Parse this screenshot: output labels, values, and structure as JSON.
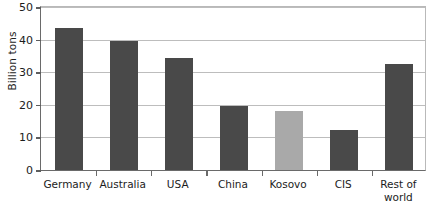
{
  "chart_data": {
    "type": "bar",
    "title": "",
    "xlabel": "",
    "ylabel": "Billion tons",
    "categories": [
      "Germany",
      "Australia",
      "USA",
      "China",
      "Kosovo",
      "CIS",
      "Rest of world"
    ],
    "values": [
      43,
      39,
      34,
      19.5,
      18,
      12,
      32
    ],
    "ylim": [
      0,
      50
    ],
    "yticks": [
      0,
      10,
      20,
      30,
      40,
      50
    ],
    "ytick_labels": [
      "0",
      "10",
      "20",
      "30",
      "40",
      "50"
    ],
    "grid": true,
    "legend": "none",
    "bar_colors": [
      "#494949",
      "#494949",
      "#494949",
      "#494949",
      "#a9a9a9",
      "#494949",
      "#494949"
    ],
    "highlight_category": "Kosovo",
    "highlight_color": "#a9a9a9",
    "default_bar_color": "#494949"
  },
  "axis": {
    "y_title": "Billion tons",
    "tick_50": "50",
    "tick_40": "40",
    "tick_30": "30",
    "tick_20": "20",
    "tick_10": "10",
    "tick_0": "0"
  },
  "x_labels": {
    "germany": "Germany",
    "australia": "Australia",
    "usa": "USA",
    "china": "China",
    "kosovo": "Kosovo",
    "cis": "CIS",
    "rest_of_world_line1": "Rest of",
    "rest_of_world_line2": "world"
  },
  "colors": {
    "bar_dark": "#494949",
    "bar_light": "#a9a9a9",
    "gridline": "#bdbdbd",
    "axis": "#6a6a6a",
    "text": "#1c1c1c",
    "background": "#ffffff"
  }
}
